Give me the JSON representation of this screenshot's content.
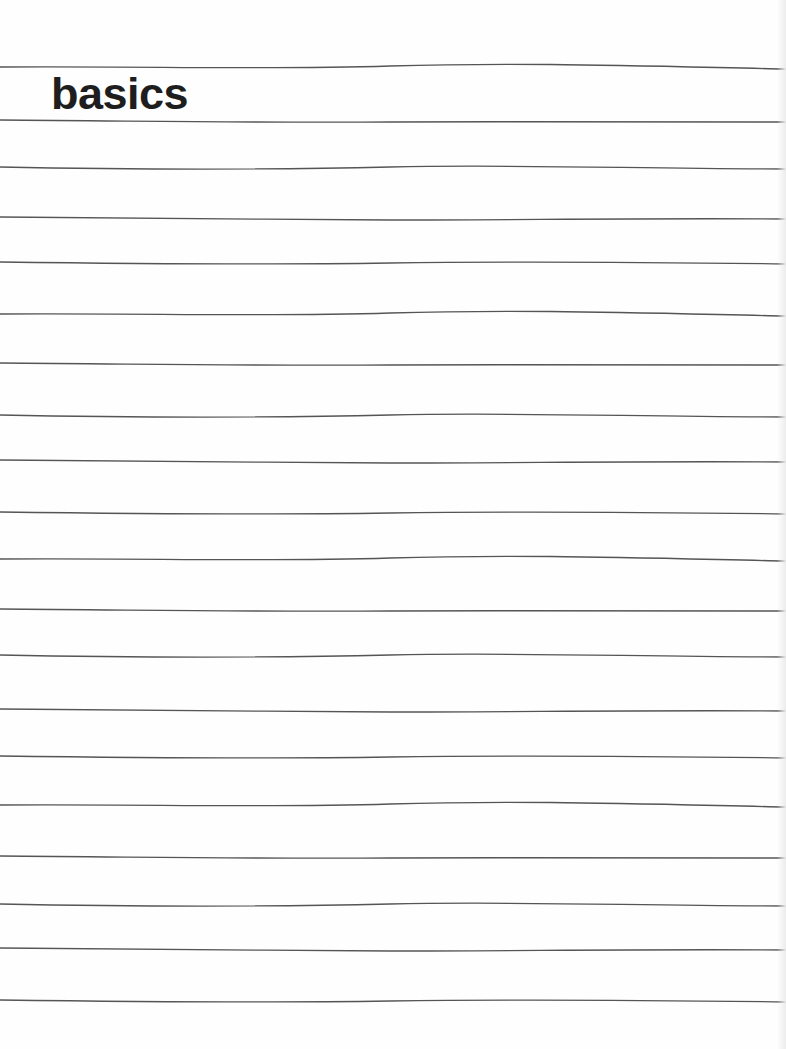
{
  "page": {
    "title": "basics",
    "line_count": 20,
    "line_positions_y": [
      68,
      121,
      168,
      218,
      263,
      315,
      364,
      416,
      461,
      513,
      560,
      610,
      656,
      710,
      757,
      806,
      857,
      905,
      949,
      1001
    ],
    "colors": {
      "paper": "#fefefe",
      "rule_line": "#555555",
      "title_text": "#1e1e1e"
    }
  }
}
